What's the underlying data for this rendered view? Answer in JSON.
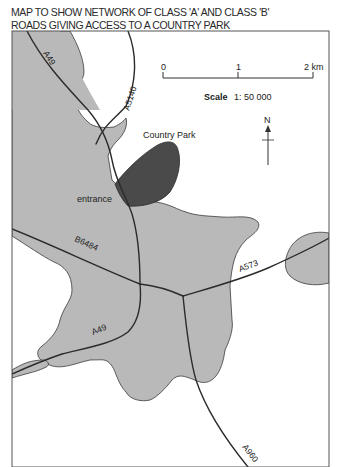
{
  "title": {
    "line1": "MAP TO SHOW NETWORK OF CLASS 'A' AND CLASS 'B'",
    "line2": "ROADS GIVING ACCESS TO A COUNTRY PARK"
  },
  "scale_bar": {
    "ticks": [
      "0",
      "1",
      "2 km"
    ],
    "label_bold": "Scale",
    "label_value": "1: 50 000"
  },
  "north_arrow": {
    "label": "N"
  },
  "areas": {
    "country_park": "Country Park",
    "entrance": "entrance"
  },
  "roads": {
    "a49_north": "A49",
    "a5140": "A5140",
    "b6484": "B6484",
    "a573": "A573",
    "a49_south": "A49",
    "a960": "A960"
  },
  "colors": {
    "urban_fill": "#b9b9b9",
    "park_fill": "#4a4a4a",
    "road_stroke": "#2b2b2b",
    "frame": "#555555",
    "background": "#ffffff"
  }
}
